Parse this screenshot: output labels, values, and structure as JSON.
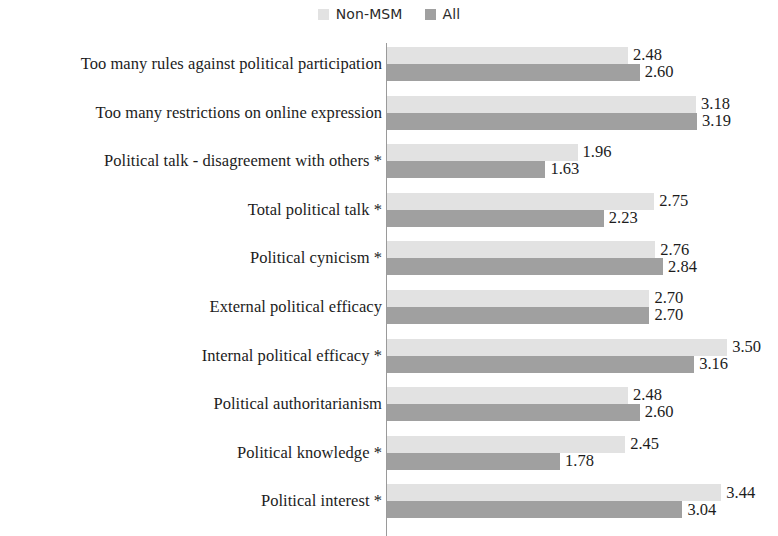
{
  "chart_data": {
    "type": "bar",
    "orientation": "horizontal",
    "title": "",
    "xlabel": "",
    "ylabel": "",
    "xlim": [
      0,
      4
    ],
    "grid": false,
    "legend_position": "top-center",
    "categories": [
      "Too many rules against political participation",
      "Too many restrictions on online expression",
      "Political talk - disagreement with others *",
      "Total political talk *",
      "Political cynicism *",
      "External political efficacy",
      "Internal political efficacy *",
      "Political authoritarianism",
      "Political knowledge *",
      "Political interest *"
    ],
    "series": [
      {
        "name": "Non-MSM",
        "color": "#e2e2e2",
        "values": [
          2.48,
          3.18,
          1.96,
          2.75,
          2.76,
          2.7,
          3.5,
          2.48,
          2.45,
          3.44
        ],
        "labels": [
          "2.48",
          "3.18",
          "1.96",
          "2.75",
          "2.76",
          "2.70",
          "3.50",
          "2.48",
          "2.45",
          "3.44"
        ]
      },
      {
        "name": "All",
        "color": "#a0a0a0",
        "values": [
          2.6,
          3.19,
          1.63,
          2.23,
          2.84,
          2.7,
          3.16,
          2.6,
          1.78,
          3.04
        ],
        "labels": [
          "2.60",
          "3.19",
          "1.63",
          "2.23",
          "2.84",
          "2.70",
          "3.16",
          "2.60",
          "1.78",
          "3.04"
        ]
      }
    ]
  },
  "legend": {
    "entries": [
      {
        "label": "Non-MSM",
        "color": "#e2e2e2"
      },
      {
        "label": "All",
        "color": "#a0a0a0"
      }
    ]
  }
}
